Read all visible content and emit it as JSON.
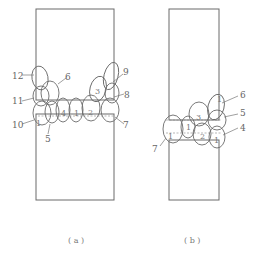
{
  "figure_a": {
    "caption": "( a )",
    "labels": {
      "l12": "12",
      "l6": "6",
      "l11": "11",
      "l10": "10",
      "l5": "5",
      "l9": "9",
      "l8": "8",
      "l7": "7",
      "l3": "3",
      "l4": "4",
      "l1": "1",
      "l2": "2",
      "i1": "1"
    }
  },
  "figure_b": {
    "caption": "( b )",
    "labels": {
      "l6": "6",
      "l5": "5",
      "l4": "4",
      "l7": "7",
      "i3": "3",
      "i2": "2",
      "i1a": "1",
      "i1b": "1",
      "i1c": "1",
      "i1d": "1"
    }
  }
}
